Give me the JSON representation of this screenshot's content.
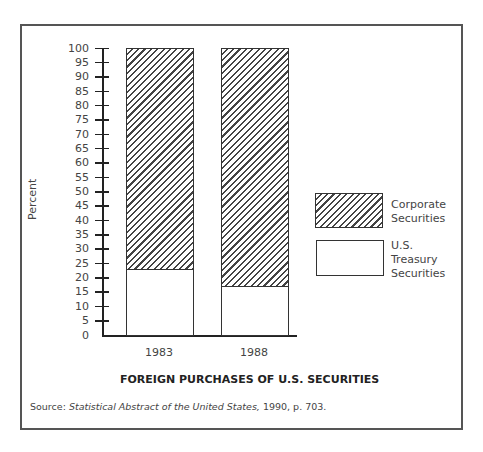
{
  "chart_data": {
    "type": "bar",
    "stacked": true,
    "title": "FOREIGN PURCHASES OF U.S. SECURITIES",
    "xlabel": "",
    "ylabel": "Percent",
    "ylim": [
      0,
      100
    ],
    "yticks": [
      0,
      5,
      10,
      15,
      20,
      25,
      30,
      35,
      40,
      45,
      50,
      55,
      60,
      65,
      70,
      75,
      80,
      85,
      90,
      95,
      100
    ],
    "categories": [
      "1983",
      "1988"
    ],
    "series": [
      {
        "name": "U.S. Treasury Securities",
        "pattern": "plain",
        "values": [
          23,
          17
        ]
      },
      {
        "name": "Corporate Securities",
        "pattern": "hatched",
        "values": [
          77,
          83
        ]
      }
    ],
    "legend_position": "right",
    "grid": false,
    "source": "Source: Statistical Abstract of the United States, 1990, p. 703."
  },
  "legend": {
    "corporate": [
      "Corporate",
      "Securities"
    ],
    "treasury": [
      "U.S.",
      "Treasury",
      "Securities"
    ]
  },
  "source": {
    "prefix": "Source:",
    "title_italic": "Statistical Abstract of the United States,",
    "suffix": "1990, p. 703."
  }
}
